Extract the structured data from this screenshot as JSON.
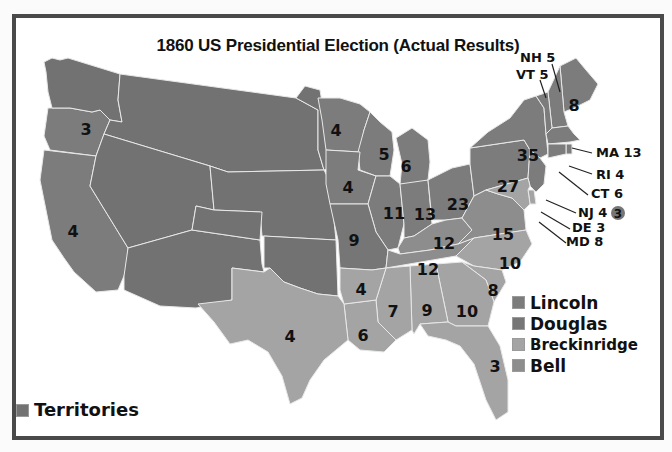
{
  "title": "1860 US Presidential Election (Actual Results)",
  "colors": {
    "lincoln": "#7c7c7c",
    "douglas": "#767676",
    "breckinridge": "#a4a4a4",
    "bell": "#8d8d8d",
    "territory": "#727272",
    "border": "#e8e8e8",
    "frame": "#4a4a4a",
    "background": "#ffffff"
  },
  "legend": {
    "items": [
      {
        "key": "lincoln",
        "label": "Lincoln"
      },
      {
        "key": "douglas",
        "label": "Douglas"
      },
      {
        "key": "breckinridge",
        "label": "Breckinridge"
      },
      {
        "key": "bell",
        "label": "Bell"
      }
    ],
    "territories": {
      "key": "territory",
      "label": "Territories"
    }
  },
  "states": [
    {
      "abbr": "OR",
      "winner": "lincoln",
      "ev": "3"
    },
    {
      "abbr": "CA",
      "winner": "lincoln",
      "ev": "4"
    },
    {
      "abbr": "WA-T",
      "winner": "territory",
      "ev": ""
    },
    {
      "abbr": "NE-T",
      "winner": "territory",
      "ev": ""
    },
    {
      "abbr": "UT-T",
      "winner": "territory",
      "ev": ""
    },
    {
      "abbr": "NM-T",
      "winner": "territory",
      "ev": ""
    },
    {
      "abbr": "KS-T",
      "winner": "territory",
      "ev": ""
    },
    {
      "abbr": "CO-T",
      "winner": "territory",
      "ev": ""
    },
    {
      "abbr": "DK-T",
      "winner": "territory",
      "ev": ""
    },
    {
      "abbr": "IND-T",
      "winner": "territory",
      "ev": ""
    },
    {
      "abbr": "MN",
      "winner": "lincoln",
      "ev": "4"
    },
    {
      "abbr": "WI",
      "winner": "lincoln",
      "ev": "5"
    },
    {
      "abbr": "IA",
      "winner": "lincoln",
      "ev": "4"
    },
    {
      "abbr": "MI",
      "winner": "lincoln",
      "ev": "6"
    },
    {
      "abbr": "IL",
      "winner": "lincoln",
      "ev": "11"
    },
    {
      "abbr": "IN",
      "winner": "lincoln",
      "ev": "13"
    },
    {
      "abbr": "OH",
      "winner": "lincoln",
      "ev": "23"
    },
    {
      "abbr": "PA",
      "winner": "lincoln",
      "ev": "27"
    },
    {
      "abbr": "NY",
      "winner": "lincoln",
      "ev": "35"
    },
    {
      "abbr": "ME",
      "winner": "lincoln",
      "ev": "8"
    },
    {
      "abbr": "MO",
      "winner": "douglas",
      "ev": "9"
    },
    {
      "abbr": "KY",
      "winner": "bell",
      "ev": "12"
    },
    {
      "abbr": "TN",
      "winner": "bell",
      "ev": "12"
    },
    {
      "abbr": "VA",
      "winner": "bell",
      "ev": "15"
    },
    {
      "abbr": "NC",
      "winner": "breckinridge",
      "ev": "10"
    },
    {
      "abbr": "SC",
      "winner": "breckinridge",
      "ev": "8"
    },
    {
      "abbr": "GA",
      "winner": "breckinridge",
      "ev": "10"
    },
    {
      "abbr": "AL",
      "winner": "breckinridge",
      "ev": "9"
    },
    {
      "abbr": "MS",
      "winner": "breckinridge",
      "ev": "7"
    },
    {
      "abbr": "LA",
      "winner": "breckinridge",
      "ev": "6"
    },
    {
      "abbr": "AR",
      "winner": "breckinridge",
      "ev": "4"
    },
    {
      "abbr": "TX",
      "winner": "breckinridge",
      "ev": "4"
    },
    {
      "abbr": "FL",
      "winner": "breckinridge",
      "ev": "3"
    },
    {
      "abbr": "NH",
      "winner": "lincoln",
      "ev": "5"
    },
    {
      "abbr": "VT",
      "winner": "lincoln",
      "ev": "5"
    },
    {
      "abbr": "MA",
      "winner": "lincoln",
      "ev": "13"
    },
    {
      "abbr": "RI",
      "winner": "lincoln",
      "ev": "4"
    },
    {
      "abbr": "CT",
      "winner": "lincoln",
      "ev": "6"
    },
    {
      "abbr": "NJ",
      "winner": "lincoln",
      "ev": "4"
    },
    {
      "abbr": "DE",
      "winner": "breckinridge",
      "ev": "3"
    },
    {
      "abbr": "MD",
      "winner": "breckinridge",
      "ev": "8"
    }
  ],
  "callouts": [
    {
      "abbr": "NH",
      "text": "NH 5"
    },
    {
      "abbr": "VT",
      "text": "VT 5"
    },
    {
      "abbr": "MA",
      "text": "MA 13"
    },
    {
      "abbr": "RI",
      "text": "RI 4"
    },
    {
      "abbr": "CT",
      "text": "CT 6"
    },
    {
      "abbr": "NJ",
      "text": "NJ 4"
    },
    {
      "abbr": "DE",
      "text": "DE 3"
    },
    {
      "abbr": "MD",
      "text": "MD 8"
    }
  ],
  "nj_split": {
    "winner": "douglas",
    "ev": "3"
  }
}
